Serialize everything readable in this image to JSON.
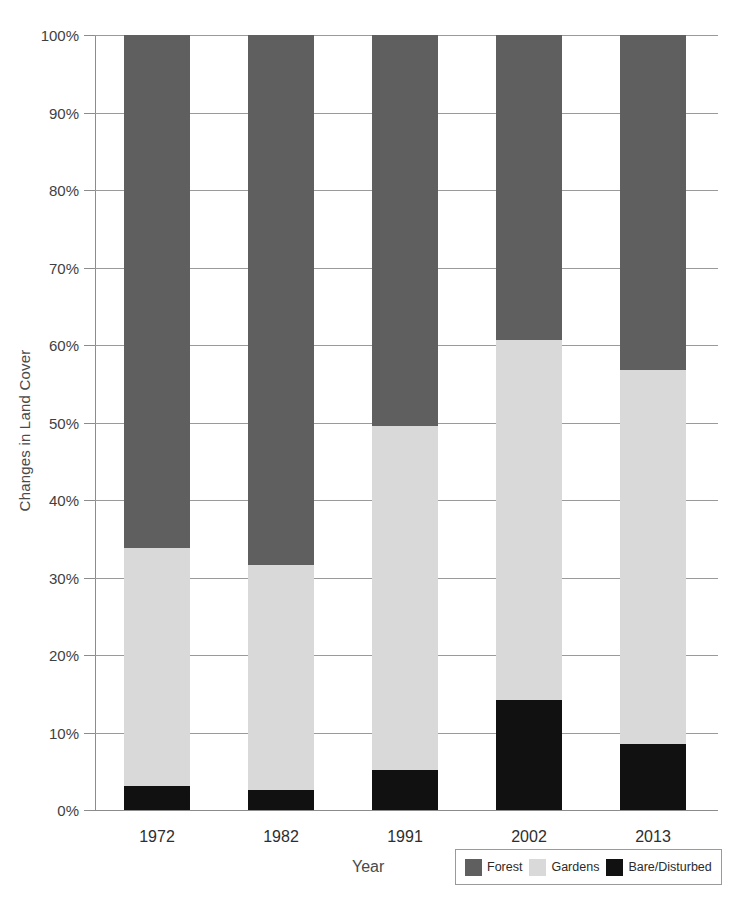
{
  "chart_data": {
    "type": "bar",
    "stacked": true,
    "stack_mode": "percent",
    "title": "",
    "xlabel": "Year",
    "ylabel": "Changes in Land Cover",
    "categories": [
      "1972",
      "1982",
      "1991",
      "2002",
      "2013"
    ],
    "ylim": [
      0,
      100
    ],
    "y_tick_labels": [
      "0%",
      "10%",
      "20%",
      "30%",
      "40%",
      "50%",
      "60%",
      "70%",
      "80%",
      "90%",
      "100%"
    ],
    "y_tick_values": [
      0,
      10,
      20,
      30,
      40,
      50,
      60,
      70,
      80,
      90,
      100
    ],
    "grid": true,
    "legend_position": "bottom-right",
    "series": [
      {
        "name": "Bare/Disturbed",
        "color": "#111111",
        "values": [
          3.1,
          2.6,
          5.2,
          14.2,
          8.5
        ]
      },
      {
        "name": "Gardens",
        "color": "#d9d9d9",
        "values": [
          30.7,
          29.0,
          44.3,
          46.4,
          48.3
        ]
      },
      {
        "name": "Forest",
        "color": "#5f5f5f",
        "values": [
          66.2,
          68.4,
          50.5,
          39.4,
          43.2
        ]
      }
    ],
    "stack_tops": {
      "bare": [
        3.1,
        2.6,
        5.2,
        14.2,
        8.5
      ],
      "gardens": [
        33.8,
        31.6,
        49.5,
        60.6,
        56.8
      ],
      "forest": [
        100,
        100,
        100,
        100,
        100
      ]
    },
    "legend": [
      {
        "label": "Forest",
        "color": "#5f5f5f"
      },
      {
        "label": "Gardens",
        "color": "#d9d9d9"
      },
      {
        "label": "Bare/Disturbed",
        "color": "#111111"
      }
    ]
  }
}
